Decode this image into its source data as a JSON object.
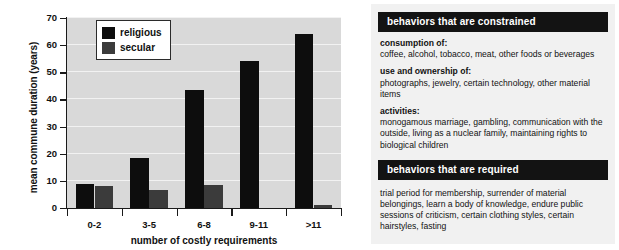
{
  "chart_data": {
    "type": "bar",
    "title": "",
    "xlabel": "number of costly requirements",
    "ylabel": "mean commune duration (years)",
    "categories": [
      "0-2",
      "3-5",
      "6-8",
      "9-11",
      ">11"
    ],
    "series": [
      {
        "name": "religious",
        "color": "#0d0d0d",
        "values": [
          9,
          18.5,
          43.5,
          54,
          64
        ]
      },
      {
        "name": "secular",
        "color": "#3b3b3b",
        "values": [
          8,
          6.8,
          8.5,
          0,
          1
        ]
      }
    ],
    "ylim": [
      0,
      70
    ],
    "yticks": [
      0,
      10,
      20,
      30,
      40,
      50,
      60,
      70
    ],
    "grid": true,
    "legend_position": "top-left",
    "plot_background": "#d9d9d9"
  },
  "legend": {
    "items": [
      {
        "label": "religious"
      },
      {
        "label": "secular"
      }
    ]
  },
  "panels": [
    {
      "header": "behaviors that are constrained",
      "groups": [
        {
          "title": "consumption of:",
          "items": "coffee, alcohol, tobacco, meat, other foods or beverages"
        },
        {
          "title": "use and ownership of:",
          "items": "photographs, jewelry, certain technology, other material items"
        },
        {
          "title": "activities:",
          "items": "monogamous marriage, gambling, communication with the outside, living as a nuclear family, maintaining rights to biological children"
        }
      ]
    },
    {
      "header": "behaviors that are required",
      "groups": [
        {
          "title": "",
          "items": "trial period for membership, surrender of material belongings, learn a body of knowledge, endure public sessions of criticism, certain clothing styles, certain hairstyles, fasting"
        }
      ]
    }
  ]
}
